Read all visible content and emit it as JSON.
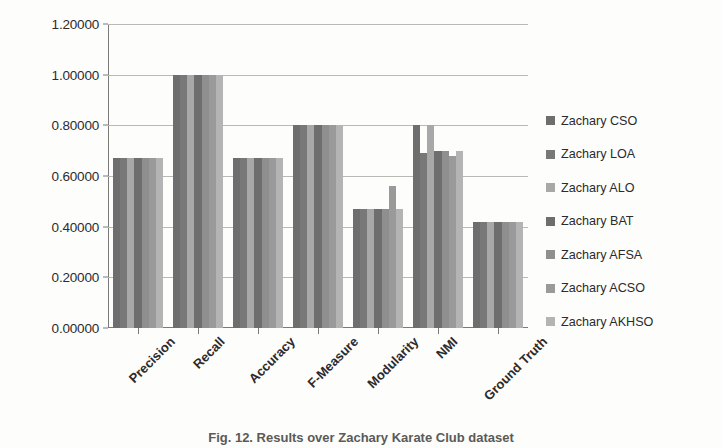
{
  "figure": {
    "caption": "Fig. 12. Results over Zachary Karate Club dataset"
  },
  "chart_data": {
    "type": "bar",
    "title": "",
    "xlabel": "",
    "ylabel": "",
    "ylim": [
      0.0,
      1.2
    ],
    "ytick_labels": [
      "0.00000",
      "0.20000",
      "0.40000",
      "0.60000",
      "0.80000",
      "1.00000",
      "1.20000"
    ],
    "ytick_values": [
      0.0,
      0.2,
      0.4,
      0.6,
      0.8,
      1.0,
      1.2
    ],
    "grid": true,
    "legend_position": "right",
    "categories": [
      "Precision",
      "Recall",
      "Accuracy",
      "F-Measure",
      "Modularity",
      "NMI",
      "Ground Truth"
    ],
    "series": [
      {
        "name": "Zachary CSO",
        "color": "#6e6e6e",
        "values": [
          0.67,
          1.0,
          0.67,
          0.8,
          0.47,
          0.8,
          0.42
        ]
      },
      {
        "name": "Zachary LOA",
        "color": "#787878",
        "values": [
          0.67,
          1.0,
          0.67,
          0.8,
          0.47,
          0.69,
          0.42
        ]
      },
      {
        "name": "Zachary ALO",
        "color": "#a8a8a8",
        "values": [
          0.67,
          1.0,
          0.67,
          0.8,
          0.47,
          0.8,
          0.42
        ]
      },
      {
        "name": "Zachary BAT",
        "color": "#6e6e6e",
        "values": [
          0.67,
          1.0,
          0.67,
          0.8,
          0.47,
          0.7,
          0.42
        ]
      },
      {
        "name": "Zachary AFSA",
        "color": "#8f8f8f",
        "values": [
          0.67,
          1.0,
          0.67,
          0.8,
          0.47,
          0.7,
          0.42
        ]
      },
      {
        "name": "Zachary ACSO",
        "color": "#9a9a9a",
        "values": [
          0.67,
          1.0,
          0.67,
          0.8,
          0.56,
          0.68,
          0.42
        ]
      },
      {
        "name": "Zachary AKHSO",
        "color": "#b4b4b4",
        "values": [
          0.67,
          1.0,
          0.67,
          0.8,
          0.47,
          0.7,
          0.42
        ]
      }
    ]
  }
}
